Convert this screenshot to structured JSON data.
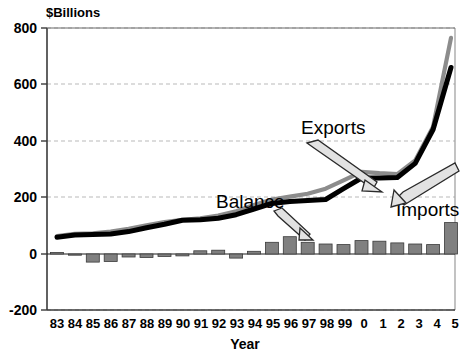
{
  "chart_data": {
    "type": "line",
    "title": "",
    "unit_label": "$Billions",
    "xlabel": "Year",
    "ylabel": "",
    "ylim": [
      -200,
      800
    ],
    "yticks": [
      800,
      600,
      400,
      200,
      0,
      -200
    ],
    "ytick_labels": [
      "800",
      "600",
      "400",
      "200",
      "0",
      "-200"
    ],
    "grid": true,
    "legend_position": "inline-annotations",
    "categories": [
      "83",
      "84",
      "85",
      "86",
      "87",
      "88",
      "89",
      "90",
      "91",
      "92",
      "93",
      "94",
      "95",
      "96",
      "97",
      "98",
      "99",
      "0",
      "1",
      "2",
      "3",
      "4",
      "5"
    ],
    "series": [
      {
        "name": "Imports",
        "type": "line",
        "color": "#8c8c8c",
        "values": [
          62,
          70,
          72,
          78,
          88,
          100,
          112,
          120,
          125,
          135,
          150,
          172,
          192,
          202,
          212,
          230,
          260,
          290,
          285,
          282,
          330,
          450,
          765
        ]
      },
      {
        "name": "Exports",
        "type": "line",
        "color": "#000000",
        "values": [
          58,
          66,
          68,
          70,
          78,
          92,
          104,
          118,
          120,
          125,
          138,
          158,
          178,
          185,
          188,
          192,
          230,
          268,
          268,
          270,
          320,
          440,
          660
        ]
      },
      {
        "name": "Balance",
        "type": "bar",
        "color": "#808080",
        "values": [
          4,
          -4,
          -30,
          -28,
          -12,
          -14,
          -10,
          -8,
          10,
          12,
          -16,
          8,
          40,
          60,
          40,
          34,
          32,
          46,
          44,
          38,
          34,
          32,
          110
        ]
      }
    ],
    "annotations": [
      {
        "label": "Exports",
        "target_series": "Exports",
        "arrow": "down-right"
      },
      {
        "label": "Imports",
        "target_series": "Imports",
        "arrow": "up-left"
      },
      {
        "label": "Balance",
        "target_series": "Balance",
        "arrow": "down-right"
      }
    ]
  },
  "labels": {
    "unit": "$Billions",
    "xaxis": "Year",
    "exports": "Exports",
    "imports": "Imports",
    "balance": "Balance"
  },
  "yticks": {
    "t0": "800",
    "t1": "600",
    "t2": "400",
    "t3": "200",
    "t4": "0",
    "t5": "-200"
  },
  "xticks": {
    "x0": "83",
    "x1": "84",
    "x2": "85",
    "x3": "86",
    "x4": "87",
    "x5": "88",
    "x6": "89",
    "x7": "90",
    "x8": "91",
    "x9": "92",
    "x10": "93",
    "x11": "94",
    "x12": "95",
    "x13": "96",
    "x14": "97",
    "x15": "98",
    "x16": "99",
    "x17": "0",
    "x18": "1",
    "x19": "2",
    "x20": "3",
    "x21": "4",
    "x22": "5"
  },
  "colors": {
    "imports_line": "#8c8c8c",
    "exports_line": "#000000",
    "balance_bar": "#808080",
    "grid": "#b9b9b9",
    "axis": "#3a3a3a",
    "background": "#ffffff"
  }
}
